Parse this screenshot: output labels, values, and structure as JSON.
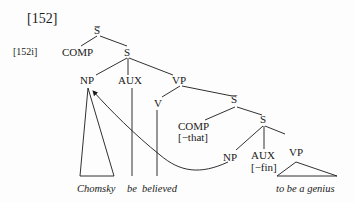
{
  "example_number": "[152]",
  "sub_example": "[152i]",
  "tree": {
    "root": "S̅",
    "comp": "COMP",
    "s": "S",
    "np": "NP",
    "aux": "AUX",
    "vp": "VP",
    "v": "V",
    "sbar2": "S̅",
    "comp2": "COMP",
    "comp2_feature": "[−that]",
    "s2": "S",
    "np2": "NP",
    "aux2": "AUX",
    "aux2_feature": "[−fin]",
    "vp2": "VP"
  },
  "words": {
    "chomsky": "Chomsky",
    "be": "be",
    "believed": "believed",
    "to_be_a_genius": "to be a genius"
  },
  "arrow": "movement from embedded NP to matrix NP"
}
